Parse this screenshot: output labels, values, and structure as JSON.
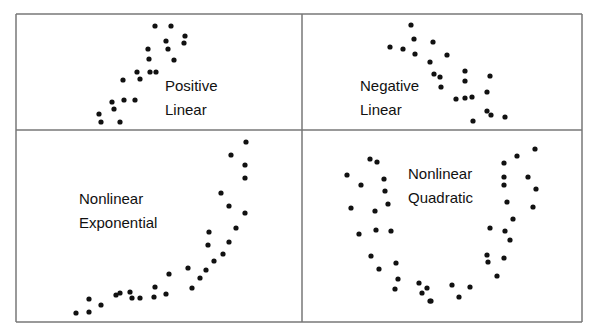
{
  "figure": {
    "frame": {
      "left": 16,
      "top": 14,
      "right": 582,
      "bottom": 322,
      "mid_x": 302,
      "mid_y": 130,
      "line_color": "#777777"
    },
    "dot_color": "#111111",
    "dot_radius": 2.6
  },
  "panels": [
    {
      "id": "positive-linear",
      "label_line1": "Positive",
      "label_line2": "Linear",
      "label_pos": {
        "x": 165,
        "y": 74
      },
      "points": [
        [
          155,
          26
        ],
        [
          171,
          26
        ],
        [
          185,
          36
        ],
        [
          184,
          43
        ],
        [
          166,
          41
        ],
        [
          168,
          49
        ],
        [
          148,
          49
        ],
        [
          149,
          59
        ],
        [
          174,
          60
        ],
        [
          150,
          72
        ],
        [
          156,
          72
        ],
        [
          137,
          72
        ],
        [
          140,
          79
        ],
        [
          123,
          80
        ],
        [
          112,
          102
        ],
        [
          124,
          100
        ],
        [
          135,
          100
        ],
        [
          114,
          109
        ],
        [
          99,
          114
        ],
        [
          101,
          122
        ],
        [
          120,
          122
        ]
      ]
    },
    {
      "id": "negative-linear",
      "label_line1": "Negative",
      "label_line2": "Linear",
      "label_pos": {
        "x": 360,
        "y": 74
      },
      "points": [
        [
          411,
          25
        ],
        [
          414,
          39
        ],
        [
          433,
          42
        ],
        [
          390,
          47
        ],
        [
          403,
          49
        ],
        [
          415,
          54
        ],
        [
          447,
          55
        ],
        [
          430,
          62
        ],
        [
          465,
          71
        ],
        [
          490,
          76
        ],
        [
          434,
          74
        ],
        [
          440,
          77
        ],
        [
          465,
          81
        ],
        [
          441,
          87
        ],
        [
          487,
          92
        ],
        [
          456,
          99
        ],
        [
          465,
          98
        ],
        [
          472,
          97
        ],
        [
          487,
          111
        ],
        [
          491,
          115
        ],
        [
          505,
          117
        ],
        [
          473,
          121
        ]
      ]
    },
    {
      "id": "nonlinear-exponential",
      "label_line1": "Nonlinear",
      "label_line2": "Exponential",
      "label_pos": {
        "x": 79,
        "y": 187
      },
      "points": [
        [
          246,
          142
        ],
        [
          231,
          155
        ],
        [
          245,
          165
        ],
        [
          245,
          178
        ],
        [
          221,
          193
        ],
        [
          229,
          206
        ],
        [
          245,
          213
        ],
        [
          236,
          228
        ],
        [
          209,
          232
        ],
        [
          229,
          242
        ],
        [
          208,
          245
        ],
        [
          223,
          254
        ],
        [
          214,
          261
        ],
        [
          188,
          268
        ],
        [
          206,
          270
        ],
        [
          169,
          274
        ],
        [
          200,
          278
        ],
        [
          192,
          288
        ],
        [
          155,
          287
        ],
        [
          116,
          295
        ],
        [
          120,
          293
        ],
        [
          130,
          292
        ],
        [
          166,
          294
        ],
        [
          132,
          298
        ],
        [
          140,
          298
        ],
        [
          154,
          297
        ],
        [
          89,
          299
        ],
        [
          101,
          305
        ],
        [
          89,
          312
        ],
        [
          76,
          313
        ]
      ]
    },
    {
      "id": "nonlinear-quadratic",
      "label_line1": "Nonlinear",
      "label_line2": "Quadratic",
      "label_pos": {
        "x": 408,
        "y": 162
      },
      "points": [
        [
          370,
          159
        ],
        [
          377,
          162
        ],
        [
          347,
          175
        ],
        [
          384,
          179
        ],
        [
          361,
          185
        ],
        [
          385,
          191
        ],
        [
          388,
          204
        ],
        [
          351,
          208
        ],
        [
          375,
          211
        ],
        [
          359,
          234
        ],
        [
          376,
          230
        ],
        [
          391,
          231
        ],
        [
          371,
          256
        ],
        [
          396,
          263
        ],
        [
          379,
          269
        ],
        [
          398,
          279
        ],
        [
          395,
          289
        ],
        [
          419,
          283
        ],
        [
          427,
          288
        ],
        [
          422,
          293
        ],
        [
          430,
          301
        ],
        [
          535,
          149
        ],
        [
          517,
          156
        ],
        [
          504,
          163
        ],
        [
          504,
          177
        ],
        [
          528,
          177
        ],
        [
          504,
          185
        ],
        [
          536,
          189
        ],
        [
          507,
          202
        ],
        [
          533,
          207
        ],
        [
          513,
          219
        ],
        [
          490,
          228
        ],
        [
          505,
          231
        ],
        [
          510,
          240
        ],
        [
          487,
          255
        ],
        [
          488,
          262
        ],
        [
          504,
          258
        ],
        [
          497,
          276
        ],
        [
          452,
          285
        ],
        [
          470,
          287
        ],
        [
          459,
          297
        ],
        [
          431,
          301
        ]
      ]
    }
  ]
}
